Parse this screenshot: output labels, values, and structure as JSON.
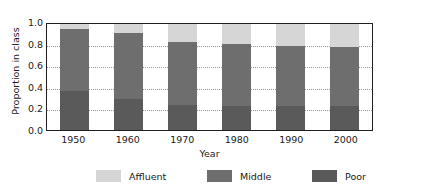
{
  "chart_data": {
    "type": "bar",
    "subtype": "stacked-bar",
    "title": "",
    "xlabel": "Year",
    "ylabel": "Proportion in class",
    "categories": [
      "1950",
      "1960",
      "1970",
      "1980",
      "1990",
      "2000"
    ],
    "ylim": [
      0.0,
      1.0
    ],
    "yticks": [
      "1.0",
      "0.8",
      "0.6",
      "0.4",
      "0.2",
      "0.0"
    ],
    "ytick_values": [
      1.0,
      0.8,
      0.6,
      0.4,
      0.2,
      0.0
    ],
    "grid": true,
    "grid_axis": "y",
    "grid_style": "dotted",
    "legend_position": "bottom",
    "series": [
      {
        "name": "Poor",
        "color": "#5a5a5a",
        "values": [
          0.37,
          0.29,
          0.24,
          0.23,
          0.23,
          0.23
        ]
      },
      {
        "name": "Middle",
        "color": "#6e6e6e",
        "values": [
          0.58,
          0.63,
          0.59,
          0.58,
          0.56,
          0.55
        ]
      },
      {
        "name": "Affluent",
        "color": "#d6d6d6",
        "values": [
          0.05,
          0.08,
          0.17,
          0.19,
          0.21,
          0.22
        ]
      }
    ],
    "stack_tops": {
      "poor": [
        0.37,
        0.29,
        0.24,
        0.23,
        0.23,
        0.23
      ],
      "middle": [
        0.95,
        0.92,
        0.83,
        0.81,
        0.79,
        0.78
      ],
      "affluent": [
        1.0,
        1.0,
        1.0,
        1.0,
        1.0,
        1.0
      ]
    }
  },
  "legend": {
    "items": [
      {
        "label": "Affluent",
        "color": "#d6d6d6"
      },
      {
        "label": "Middle",
        "color": "#6e6e6e"
      },
      {
        "label": "Poor",
        "color": "#5a5a5a"
      }
    ]
  },
  "axes": {
    "frame_color": "#231f20",
    "grid_color": "#9a9a9a"
  }
}
